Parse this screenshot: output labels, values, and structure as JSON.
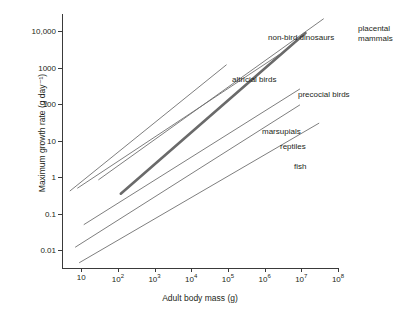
{
  "chart_data": {
    "type": "line",
    "title": "",
    "xlabel": "Adult body mass (g)",
    "ylabel": "Maximum growth rate (g day⁻¹)",
    "xscale": "log",
    "yscale": "log",
    "xlim": [
      3,
      100000000
    ],
    "ylim": [
      0.003,
      30000
    ],
    "grid": false,
    "legend_position": "inline-annotations",
    "xticks": [
      {
        "value": 10,
        "label": "10"
      },
      {
        "value": 100,
        "label": "10",
        "exp": "2"
      },
      {
        "value": 1000,
        "label": "10",
        "exp": "3"
      },
      {
        "value": 10000,
        "label": "10",
        "exp": "4"
      },
      {
        "value": 100000,
        "label": "10",
        "exp": "5"
      },
      {
        "value": 1000000,
        "label": "10",
        "exp": "6"
      },
      {
        "value": 10000000,
        "label": "10",
        "exp": "7"
      },
      {
        "value": 100000000,
        "label": "10",
        "exp": "8"
      }
    ],
    "yticks": [
      {
        "value": 0.01,
        "label": "0.01"
      },
      {
        "value": 0.1,
        "label": "0.1"
      },
      {
        "value": 1,
        "label": "1"
      },
      {
        "value": 10,
        "label": "10"
      },
      {
        "value": 100,
        "label": "100"
      },
      {
        "value": 1000,
        "label": "1000"
      },
      {
        "value": 10000,
        "label": "10,000"
      }
    ],
    "series": [
      {
        "name": "placental mammals",
        "color": "#6f6f6f",
        "width": 0.9,
        "x": [
          30,
          40000000
        ],
        "y": [
          0.85,
          22000
        ]
      },
      {
        "name": "non-bird dinosaurs",
        "color": "#6a6a6a",
        "width": 2.6,
        "x": [
          120,
          13000000
        ],
        "y": [
          0.35,
          9000
        ]
      },
      {
        "name": "precocial birds",
        "color": "#6f6f6f",
        "width": 0.9,
        "x": [
          8,
          2500000
        ],
        "y": [
          0.5,
          2300
        ]
      },
      {
        "name": "altricial birds",
        "color": "#6f6f6f",
        "width": 0.9,
        "x": [
          5,
          90000
        ],
        "y": [
          0.42,
          1200
        ]
      },
      {
        "name": "marsupials",
        "color": "#6f6f6f",
        "width": 0.9,
        "x": [
          12,
          9000000
        ],
        "y": [
          0.05,
          260
        ]
      },
      {
        "name": "reptiles",
        "color": "#6f6f6f",
        "width": 0.9,
        "x": [
          7,
          9000000
        ],
        "y": [
          0.012,
          95
        ]
      },
      {
        "name": "fish",
        "color": "#6f6f6f",
        "width": 0.9,
        "x": [
          9,
          30000000
        ],
        "y": [
          0.0045,
          30
        ]
      }
    ],
    "annotations": [
      {
        "text": "placental\nmammals",
        "x_px": 296,
        "y_px": 10
      },
      {
        "text": "non-bird dinosaurs",
        "x_px": 206,
        "y_px": 19
      },
      {
        "text": "precocial birds",
        "x_px": 236,
        "y_px": 76
      },
      {
        "text": "altricial birds",
        "x_px": 170,
        "y_px": 61
      },
      {
        "text": "marsupials",
        "x_px": 200,
        "y_px": 113
      },
      {
        "text": "reptiles",
        "x_px": 218,
        "y_px": 128
      },
      {
        "text": "fish",
        "x_px": 232,
        "y_px": 148
      }
    ]
  }
}
